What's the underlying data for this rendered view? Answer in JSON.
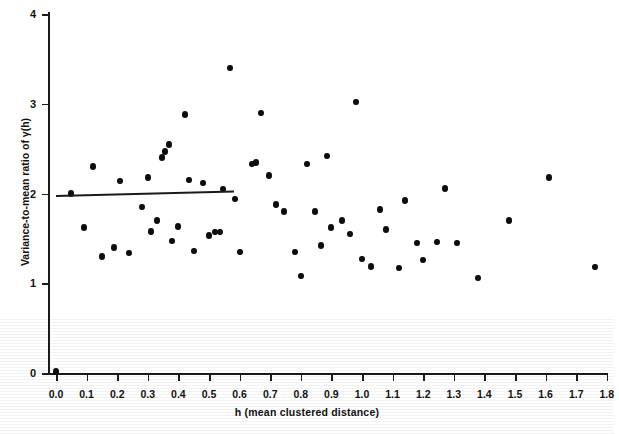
{
  "chart_data": {
    "type": "scatter",
    "title": "",
    "xlabel": "h (mean clustered distance)",
    "ylabel": "Variance-to-mean ratio of γ(h)",
    "xlim": [
      0.0,
      1.8
    ],
    "ylim": [
      0,
      4
    ],
    "xticks": [
      "0.0",
      "0.1",
      "0.2",
      "0.3",
      "0.4",
      "0.5",
      "0.6",
      "0.7",
      "0.8",
      "0.9",
      "1.0",
      "1.1",
      "1.2",
      "1.3",
      "1.4",
      "1.5",
      "1.6",
      "1.7",
      "1.8"
    ],
    "yticks": [
      "0",
      "1",
      "2",
      "3",
      "4"
    ],
    "grid": false,
    "legend": null,
    "marker": "filled-circle",
    "marker_color": "#0d0d0d",
    "points": [
      {
        "x": 0.0,
        "y": 0.02
      },
      {
        "x": 0.05,
        "y": 2.0
      },
      {
        "x": 0.09,
        "y": 1.62
      },
      {
        "x": 0.12,
        "y": 2.3
      },
      {
        "x": 0.15,
        "y": 1.3
      },
      {
        "x": 0.19,
        "y": 1.4
      },
      {
        "x": 0.21,
        "y": 2.14
      },
      {
        "x": 0.24,
        "y": 1.34
      },
      {
        "x": 0.28,
        "y": 1.85
      },
      {
        "x": 0.3,
        "y": 2.18
      },
      {
        "x": 0.31,
        "y": 1.58
      },
      {
        "x": 0.33,
        "y": 1.7
      },
      {
        "x": 0.345,
        "y": 2.4
      },
      {
        "x": 0.355,
        "y": 2.47
      },
      {
        "x": 0.37,
        "y": 2.55
      },
      {
        "x": 0.38,
        "y": 1.47
      },
      {
        "x": 0.4,
        "y": 1.63
      },
      {
        "x": 0.42,
        "y": 2.88
      },
      {
        "x": 0.435,
        "y": 2.15
      },
      {
        "x": 0.45,
        "y": 1.36
      },
      {
        "x": 0.48,
        "y": 2.12
      },
      {
        "x": 0.5,
        "y": 1.53
      },
      {
        "x": 0.52,
        "y": 1.57
      },
      {
        "x": 0.535,
        "y": 1.57
      },
      {
        "x": 0.545,
        "y": 2.05
      },
      {
        "x": 0.57,
        "y": 3.4
      },
      {
        "x": 0.585,
        "y": 1.94
      },
      {
        "x": 0.6,
        "y": 1.35
      },
      {
        "x": 0.64,
        "y": 2.33
      },
      {
        "x": 0.655,
        "y": 2.35
      },
      {
        "x": 0.67,
        "y": 2.9
      },
      {
        "x": 0.695,
        "y": 2.2
      },
      {
        "x": 0.72,
        "y": 1.88
      },
      {
        "x": 0.745,
        "y": 1.8
      },
      {
        "x": 0.78,
        "y": 1.35
      },
      {
        "x": 0.8,
        "y": 1.08
      },
      {
        "x": 0.82,
        "y": 2.33
      },
      {
        "x": 0.845,
        "y": 1.8
      },
      {
        "x": 0.865,
        "y": 1.42
      },
      {
        "x": 0.885,
        "y": 2.42
      },
      {
        "x": 0.9,
        "y": 1.62
      },
      {
        "x": 0.935,
        "y": 1.7
      },
      {
        "x": 0.96,
        "y": 1.55
      },
      {
        "x": 0.98,
        "y": 3.02
      },
      {
        "x": 1.0,
        "y": 1.27
      },
      {
        "x": 1.03,
        "y": 1.19
      },
      {
        "x": 1.06,
        "y": 1.82
      },
      {
        "x": 1.08,
        "y": 1.6
      },
      {
        "x": 1.12,
        "y": 1.17
      },
      {
        "x": 1.14,
        "y": 1.92
      },
      {
        "x": 1.18,
        "y": 1.45
      },
      {
        "x": 1.2,
        "y": 1.26
      },
      {
        "x": 1.245,
        "y": 1.46
      },
      {
        "x": 1.27,
        "y": 2.06
      },
      {
        "x": 1.31,
        "y": 1.45
      },
      {
        "x": 1.38,
        "y": 1.06
      },
      {
        "x": 1.48,
        "y": 1.7
      },
      {
        "x": 1.61,
        "y": 2.18
      },
      {
        "x": 1.76,
        "y": 1.18
      }
    ],
    "trend_line": {
      "style": "solid",
      "color": "#1a1a1a",
      "x_start": 0.0,
      "x_end": 0.58,
      "y_start": 1.98,
      "y_end": 2.03
    }
  }
}
